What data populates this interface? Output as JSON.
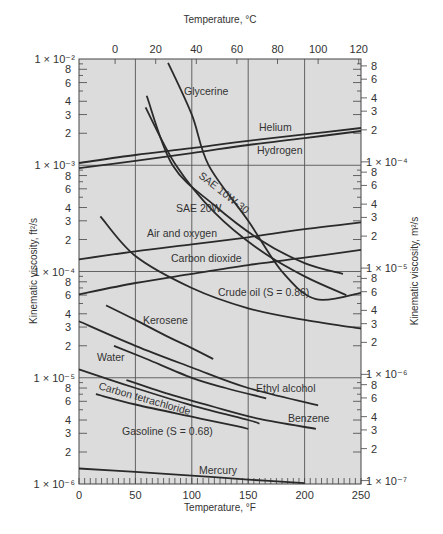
{
  "chart_data": {
    "type": "line",
    "title": "",
    "xlabel": "Temperature, °F",
    "x2label": "Temperature, °C",
    "ylabel": "Kinematic viscosity, ft²/s",
    "y2label": "Kinematic viscosity, m²/s",
    "xlim": [
      0,
      250
    ],
    "ylim": [
      1e-06,
      0.01
    ],
    "yscale": "log",
    "grid": true,
    "x_ticks": [
      "0",
      "50",
      "100",
      "150",
      "200",
      "250"
    ],
    "x_tick_values": [
      0,
      50,
      100,
      150,
      200,
      250
    ],
    "x2_ticks": [
      "0",
      "20",
      "40",
      "60",
      "80",
      "100",
      "120"
    ],
    "x2_tick_values_C": [
      0,
      20,
      40,
      60,
      80,
      100,
      120
    ],
    "y_decade_labels": [
      "1 × 10⁻²",
      "1 × 10⁻³",
      "1 × 10⁻⁴",
      "1 × 10⁻⁵",
      "1 × 10⁻⁶"
    ],
    "y_decade_values": [
      0.01,
      0.001,
      0.0001,
      1e-05,
      1e-06
    ],
    "y2_decade_labels": [
      "1 × 10⁻⁴",
      "1 × 10⁻⁵",
      "1 × 10⁻⁶",
      "1 × 10⁻⁷"
    ],
    "y2_decade_values_m2s": [
      0.0001,
      1e-05,
      1e-06,
      1e-07
    ],
    "minor_labels": [
      "8",
      "6",
      "4",
      "3",
      "2"
    ],
    "series": [
      {
        "name": "Glycerine",
        "x": [
          79,
          100,
          115,
          150,
          180,
          210,
          250
        ],
        "y": [
          0.0092,
          0.003,
          0.001,
          0.0003,
          0.0001,
          5.5e-05,
          6.3e-05
        ]
      },
      {
        "name": "Helium",
        "x": [
          0,
          50,
          100,
          150,
          200,
          250
        ],
        "y": [
          0.00105,
          0.00125,
          0.00145,
          0.0017,
          0.00195,
          0.00224
        ]
      },
      {
        "name": "Hydrogen",
        "x": [
          0,
          50,
          100,
          150,
          200,
          250
        ],
        "y": [
          0.00094,
          0.0011,
          0.0013,
          0.00155,
          0.0018,
          0.0021
        ]
      },
      {
        "name": "SAE 10W-30",
        "x": [
          60,
          83,
          120,
          160,
          200,
          234
        ],
        "y": [
          0.0045,
          0.001,
          0.00042,
          0.0002,
          0.00012,
          9.5e-05
        ]
      },
      {
        "name": "SAE 20W",
        "x": [
          59,
          86,
          120,
          160,
          200,
          237
        ],
        "y": [
          0.0035,
          0.001,
          0.00036,
          0.00016,
          9e-05,
          6e-05
        ]
      },
      {
        "name": "Air and oxygen",
        "x": [
          0,
          50,
          100,
          150,
          200,
          250
        ],
        "y": [
          0.00013,
          0.000155,
          0.00018,
          0.00021,
          0.00025,
          0.00029
        ]
      },
      {
        "name": "Carbon dioxide",
        "x": [
          0,
          50,
          100,
          150,
          200,
          250
        ],
        "y": [
          6.1e-05,
          7.8e-05,
          9.5e-05,
          0.000115,
          0.000135,
          0.00016
        ]
      },
      {
        "name": "Crude oil (S = 0.86)",
        "x": [
          19,
          50,
          100,
          150,
          200,
          250
        ],
        "y": [
          0.00033,
          0.00014,
          7e-05,
          4.5e-05,
          3.5e-05,
          2.9e-05
        ]
      },
      {
        "name": "Kerosene",
        "x": [
          24,
          50,
          80,
          100,
          119
        ],
        "y": [
          4.8e-05,
          3.5e-05,
          2.4e-05,
          1.9e-05,
          1.5e-05
        ]
      },
      {
        "name": "Water",
        "x": [
          0,
          50,
          100,
          150,
          212
        ],
        "y": [
          3.4e-05,
          2e-05,
          1.25e-05,
          8e-06,
          5.5e-06
        ]
      },
      {
        "name": "Ethyl alcohol",
        "x": [
          31,
          60,
          100,
          130,
          166
        ],
        "y": [
          2e-05,
          1.5e-05,
          1e-05,
          8e-06,
          6.4e-06
        ]
      },
      {
        "name": "Carbon tetrachloride",
        "x": [
          0,
          50,
          100,
          150,
          160
        ],
        "y": [
          1.2e-05,
          8e-06,
          5.5e-06,
          4e-06,
          3.7e-06
        ]
      },
      {
        "name": "Benzene",
        "x": [
          42,
          80,
          120,
          160,
          210
        ],
        "y": [
          9.5e-06,
          7e-06,
          5.3e-06,
          4.1e-06,
          3.3e-06
        ]
      },
      {
        "name": "Gasoline (S = 0.68)",
        "x": [
          15,
          50,
          100,
          140,
          150
        ],
        "y": [
          7e-06,
          5.6e-06,
          4.3e-06,
          3.5e-06,
          3.3e-06
        ]
      },
      {
        "name": "Mercury",
        "x": [
          0,
          50,
          100,
          150,
          200
        ],
        "y": [
          1.4e-06,
          1.3e-06,
          1.2e-06,
          1.1e-06,
          1.02e-06
        ]
      }
    ],
    "labels": {
      "glycerine": "Glycerine",
      "helium": "Helium",
      "hydrogen": "Hydrogen",
      "sae10w30": "SAE 10W-30",
      "sae20w": "SAE 20W",
      "air": "Air and oxygen",
      "co2": "Carbon dioxide",
      "crude": "Crude oil (S = 0.86)",
      "kerosene": "Kerosene",
      "water": "Water",
      "ethyl": "Ethyl alcohol",
      "ccl4": "Carbon tetrachloride",
      "benzene": "Benzene",
      "gasoline": "Gasoline (S = 0.68)",
      "mercury": "Mercury"
    }
  }
}
